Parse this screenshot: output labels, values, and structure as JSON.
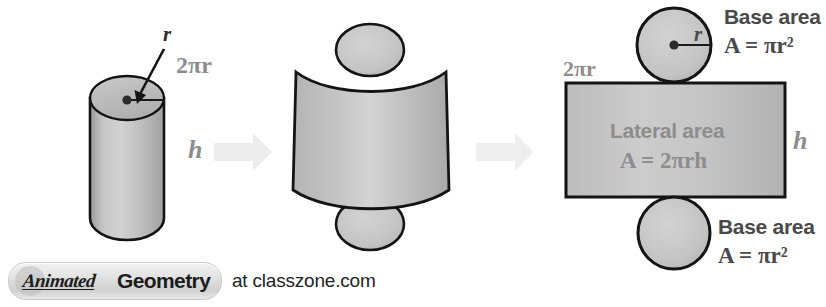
{
  "diagram": {
    "colors": {
      "solid_fill_light": "#cfcfcf",
      "solid_fill_mid": "#b8b8b8",
      "solid_fill_dark": "#9e9e9e",
      "outline": "#1a1a1a",
      "gray_label": "#8d8d8d",
      "dark_label": "#4a4a4a",
      "arrow": "#ececec",
      "background": "#ffffff"
    },
    "panels": {
      "left": {
        "name": "cylinder-solid",
        "labels": {
          "radius": "r",
          "circumference": "2πr",
          "height": "h"
        }
      },
      "middle": {
        "name": "unrolling-cylinder",
        "labels": {}
      },
      "right": {
        "name": "flat-net",
        "labels": {
          "circumference": "2πr",
          "height": "h",
          "radius": "r",
          "top_base_title": "Base area",
          "top_base_formula": "A = πr²",
          "lateral_title": "Lateral area",
          "lateral_formula": "A = 2πrh",
          "bottom_base_title": "Base area",
          "bottom_base_formula": "A = πr²"
        }
      }
    },
    "arrows": {
      "first_label": "transform-arrow-1",
      "second_label": "transform-arrow-2"
    }
  },
  "footer": {
    "badge_animated": "Animated",
    "badge_geometry": "Geometry",
    "url_text": "at classzone.com"
  }
}
